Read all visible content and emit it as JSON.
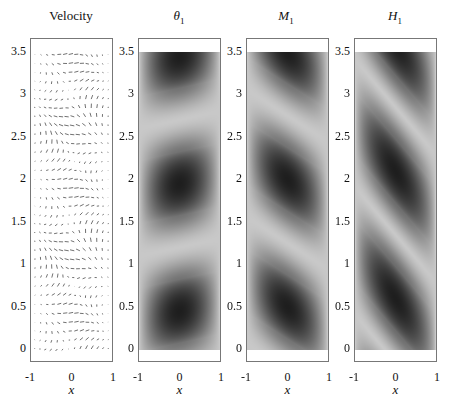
{
  "chart_data": [
    {
      "type": "heatmap",
      "subtype": "quiver",
      "title": "Velocity",
      "xlabel": "x",
      "ylabel": "",
      "xlim": [
        -1,
        1
      ],
      "ylim": [
        -0.15,
        3.65
      ],
      "xticks": [
        "-1",
        "0",
        "1"
      ],
      "yticks": [
        "0",
        "0.5",
        "1",
        "1.5",
        "2",
        "2.5",
        "3",
        "3.5"
      ],
      "description": "Velocity field arrows; wavy horizontal bands alternating direction, period ~1.6 in y"
    },
    {
      "type": "heatmap",
      "title": "θ1",
      "xlabel": "x",
      "xlim": [
        -1,
        1
      ],
      "ylim": [
        -0.15,
        3.65
      ],
      "data_ylim": [
        0,
        3.5
      ],
      "xticks": [
        "-1",
        "0",
        "1"
      ],
      "yticks": [
        "0",
        "0.5",
        "1",
        "1.5",
        "2",
        "2.5",
        "3",
        "3.5"
      ],
      "colormap": "gray",
      "dark_cells_centers_y": [
        0.45,
        1.95,
        3.4
      ],
      "tilt": "slight"
    },
    {
      "type": "heatmap",
      "title": "M1",
      "xlabel": "x",
      "xlim": [
        -1,
        1
      ],
      "ylim": [
        -0.15,
        3.65
      ],
      "data_ylim": [
        0,
        3.5
      ],
      "xticks": [
        "-1",
        "0",
        "1"
      ],
      "yticks": [
        "0",
        "0.5",
        "1",
        "1.5",
        "2",
        "2.5",
        "3",
        "3.5"
      ],
      "colormap": "gray",
      "dark_cells_centers_y": [
        0.5,
        1.95,
        3.35
      ],
      "tilt": "moderate, leaning right"
    },
    {
      "type": "heatmap",
      "title": "H1",
      "xlabel": "x",
      "xlim": [
        -1,
        1
      ],
      "ylim": [
        -0.15,
        3.65
      ],
      "data_ylim": [
        0,
        3.5
      ],
      "xticks": [
        "-1",
        "0",
        "1"
      ],
      "yticks": [
        "0",
        "0.5",
        "1",
        "1.5",
        "2",
        "2.5",
        "3",
        "3.5"
      ],
      "colormap": "gray",
      "dark_cells_centers_y": [
        0.6,
        2.0,
        3.3
      ],
      "tilt": "strong diagonal bands, leaning left-down"
    }
  ],
  "panels": [
    {
      "title": "Velocity",
      "title_main": "Velocity",
      "title_sub": ""
    },
    {
      "title_main": "θ",
      "title_sub": "1"
    },
    {
      "title_main": "M",
      "title_sub": "1"
    },
    {
      "title_main": "H",
      "title_sub": "1"
    }
  ],
  "yticks": [
    "3.5",
    "3",
    "2.5",
    "2",
    "1.5",
    "1",
    "0.5",
    "0"
  ],
  "xticks": [
    "-1",
    "0",
    "1"
  ],
  "xlabel": "x"
}
